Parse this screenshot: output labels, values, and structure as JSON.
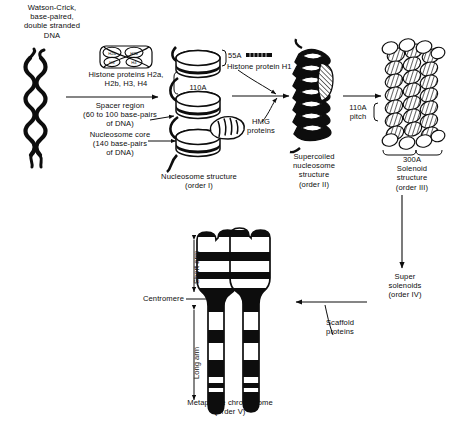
{
  "diagram": {
    "title_label": "Watson-Crick,\nbase-paired,\ndouble stranded\nDNA",
    "steps": {
      "histone_proteins": "Histone proteins H2a,\nH2b, H3, H4",
      "spacer_region": "Spacer region\n(60 to 100 base-pairs\nof DNA)",
      "nucleosome_core": "Nucleosome core\n(140 base-pairs\nof DNA)",
      "nucleosome_structure": "Nucleosome structure\n(order I)",
      "nucleosome_height": "110A",
      "h1_measure": "55A",
      "histone_h1": "Histone protein H1",
      "hmg_proteins": "HMG\nproteins",
      "supercoiled_structure": "Supercoiled\nnucleosome\nstructure\n(order II)",
      "pitch": "110A\npitch",
      "solenoid_structure": "300A\nSolenoid\nstructure\n(order III)",
      "super_solenoids": "Super\nsolenoids\n(order IV)",
      "scaffold_proteins": "Scaffold\nproteins",
      "short_arm": "Short arm",
      "long_arm": "Long arm",
      "centromere": "Centromere",
      "metaphase_chromosome": "Metaphase chromosome\n(order V)"
    },
    "histone_octamer_subunits": [
      "H2a",
      "H2b",
      "H3",
      "H4",
      "H3",
      "H4"
    ],
    "colors": {
      "ink": "#0d0d0d",
      "paper": "#ffffff"
    }
  }
}
